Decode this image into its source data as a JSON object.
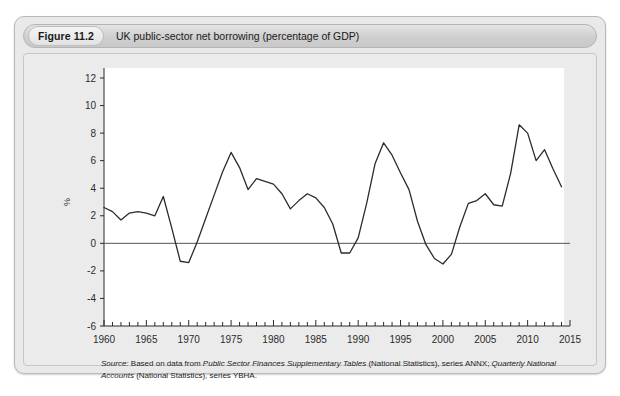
{
  "figure": {
    "badge": "Figure 11.2",
    "title": "UK public-sector net borrowing (percentage of GDP)"
  },
  "source": {
    "label": "Source:",
    "text_1": " Based on data from ",
    "italic_1": "Public Sector Finances Supplementary Tables",
    "text_2": " (National Statistics), series ANNX; ",
    "italic_2": "Quarterly National Accounts",
    "text_3": " (National Statistics), series YBHA."
  },
  "chart_data": {
    "type": "line",
    "title": "UK public-sector net borrowing (percentage of GDP)",
    "xlabel": "",
    "ylabel": "%",
    "xlim": [
      1960,
      2015
    ],
    "ylim": [
      -6,
      12
    ],
    "ytick_step": 2,
    "xtick_step": 5,
    "x_minor_tick_step": 1,
    "grid": false,
    "legend": "none",
    "zero_line": 0,
    "line_color": "#2b2b2b",
    "plot_background": "#ffffff",
    "panel_background": "#ebebeb",
    "yticks": [
      -6,
      -4,
      -2,
      0,
      2,
      4,
      6,
      8,
      10,
      12
    ],
    "xticks": [
      1960,
      1965,
      1970,
      1975,
      1980,
      1985,
      1990,
      1995,
      2000,
      2005,
      2010,
      2015
    ],
    "series": [
      {
        "name": "UK public-sector net borrowing (% of GDP)",
        "x": [
          1960,
          1961,
          1962,
          1963,
          1964,
          1965,
          1966,
          1967,
          1968,
          1969,
          1970,
          1971,
          1972,
          1973,
          1974,
          1975,
          1976,
          1977,
          1978,
          1979,
          1980,
          1981,
          1982,
          1983,
          1984,
          1985,
          1986,
          1987,
          1988,
          1989,
          1990,
          1991,
          1992,
          1993,
          1994,
          1995,
          1996,
          1997,
          1998,
          1999,
          2000,
          2001,
          2002,
          2003,
          2004,
          2005,
          2006,
          2007,
          2008,
          2009,
          2010,
          2011,
          2012,
          2013,
          2014
        ],
        "y": [
          2.6,
          2.3,
          1.7,
          2.2,
          2.3,
          2.2,
          2.0,
          3.4,
          1.1,
          -1.3,
          -1.4,
          0.1,
          1.8,
          3.5,
          5.2,
          6.6,
          5.5,
          3.9,
          4.7,
          4.5,
          4.3,
          3.6,
          2.5,
          3.1,
          3.6,
          3.3,
          2.6,
          1.4,
          -0.7,
          -0.7,
          0.4,
          2.9,
          5.8,
          7.3,
          6.4,
          5.1,
          3.9,
          1.6,
          -0.1,
          -1.1,
          -1.5,
          -0.8,
          1.2,
          2.9,
          3.1,
          3.6,
          2.8,
          2.7,
          5.1,
          8.6,
          8.0,
          6.0,
          6.8,
          5.4,
          4.1
        ]
      }
    ]
  },
  "axis": {
    "y_title": "%"
  }
}
